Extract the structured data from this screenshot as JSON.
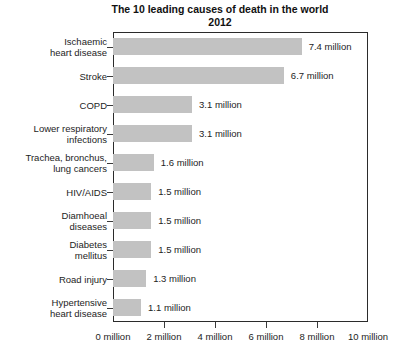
{
  "chart_data": {
    "type": "bar",
    "orientation": "horizontal",
    "title": "The 10 leading causes of death in the world\n2012",
    "xlabel": "",
    "ylabel": "",
    "xlim": [
      0,
      10
    ],
    "grid": false,
    "legend": null,
    "bar_color": "#c2c2c2",
    "frame_color": "#2b2b2b",
    "unit": "million",
    "categories": [
      "Ischaemic\nheart disease",
      "Stroke",
      "COPD",
      "Lower respiratory\ninfections",
      "Trachea, bronchus,\nlung cancers",
      "HIV/AIDS",
      "Diamhoeal\ndiseases",
      "Diabetes\nmellitus",
      "Road injury",
      "Hypertensive\nheart disease"
    ],
    "values": [
      7.4,
      6.7,
      3.1,
      3.1,
      1.6,
      1.5,
      1.5,
      1.5,
      1.3,
      1.1
    ],
    "data_labels": [
      "7.4 million",
      "6.7 million",
      "3.1 million",
      "3.1 million",
      "1.6 million",
      "1.5 million",
      "1.5 million",
      "1.5 million",
      "1.3 million",
      "1.1 million"
    ],
    "xticks": [
      0,
      2,
      4,
      6,
      8,
      10
    ],
    "xticklabels": [
      "0 million",
      "2 million",
      "4 million",
      "6 million",
      "8 million",
      "10 million"
    ]
  }
}
